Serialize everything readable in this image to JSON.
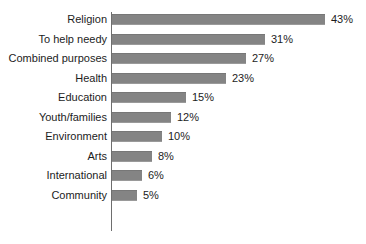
{
  "chart_data": {
    "type": "bar",
    "orientation": "horizontal",
    "title": "",
    "subtitle": "",
    "xlabel": "",
    "ylabel": "",
    "grid": false,
    "legend": false,
    "legend_position": "none",
    "xlim": [
      0,
      43
    ],
    "value_suffix": "%",
    "bar_color": "#848484",
    "text_color": "#1c1c1c",
    "axis_color": "#6e6e6e",
    "background": "#ffffff",
    "categories": [
      "Religion",
      "To help needy",
      "Combined purposes",
      "Health",
      "Education",
      "Youth/families",
      "Environment",
      "Arts",
      "International",
      "Community"
    ],
    "values": [
      43,
      31,
      27,
      23,
      15,
      12,
      10,
      8,
      6,
      5
    ],
    "value_labels": [
      "43%",
      "31%",
      "27%",
      "23%",
      "15%",
      "12%",
      "10%",
      "8%",
      "6%",
      "5%"
    ],
    "bars": [
      {
        "label": "Religion",
        "value": 43,
        "value_label": "43%"
      },
      {
        "label": "To help needy",
        "value": 31,
        "value_label": "31%"
      },
      {
        "label": "Combined purposes",
        "value": 27,
        "value_label": "27%"
      },
      {
        "label": "Health",
        "value": 23,
        "value_label": "23%"
      },
      {
        "label": "Education",
        "value": 15,
        "value_label": "15%"
      },
      {
        "label": "Youth/families",
        "value": 12,
        "value_label": "12%"
      },
      {
        "label": "Environment",
        "value": 10,
        "value_label": "10%"
      },
      {
        "label": "Arts",
        "value": 8,
        "value_label": "8%"
      },
      {
        "label": "International",
        "value": 6,
        "value_label": "6%"
      },
      {
        "label": "Community",
        "value": 5,
        "value_label": "5%"
      }
    ]
  },
  "layout": {
    "axis_x": 111,
    "bar_start_x": 112,
    "first_bar_top": 14,
    "row_pitch": 19.5,
    "bar_height": 11,
    "px_per_unit": 4.95,
    "value_label_gap": 6
  }
}
